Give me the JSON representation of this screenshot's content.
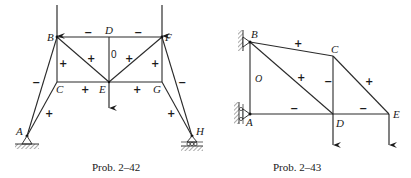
{
  "figures": [
    {
      "id": "prob-2-42",
      "caption": "Prob. 2–42",
      "nodes": {
        "A": {
          "label": "A"
        },
        "B": {
          "label": "B"
        },
        "C": {
          "label": "C"
        },
        "D": {
          "label": "D"
        },
        "E": {
          "label": "E"
        },
        "F": {
          "label": "F"
        },
        "G": {
          "label": "G"
        },
        "H": {
          "label": "H"
        }
      },
      "members": [
        {
          "from": "B",
          "to": "D",
          "sign": "−"
        },
        {
          "from": "D",
          "to": "F",
          "sign": "−"
        },
        {
          "from": "B",
          "to": "C",
          "sign": "+"
        },
        {
          "from": "B",
          "to": "E",
          "sign": "+"
        },
        {
          "from": "D",
          "to": "E",
          "sign": "0"
        },
        {
          "from": "F",
          "to": "E",
          "sign": "+"
        },
        {
          "from": "F",
          "to": "G",
          "sign": "+"
        },
        {
          "from": "C",
          "to": "E",
          "sign": "+"
        },
        {
          "from": "E",
          "to": "G",
          "sign": "+"
        },
        {
          "from": "A",
          "to": "B",
          "sign": "−"
        },
        {
          "from": "A",
          "to": "C",
          "sign": "+"
        },
        {
          "from": "H",
          "to": "F",
          "sign": "−"
        },
        {
          "from": "H",
          "to": "G",
          "sign": "+"
        }
      ],
      "loads": [
        "B",
        "F",
        "E"
      ],
      "supports": {
        "A": "pin",
        "H": "roller"
      }
    },
    {
      "id": "prob-2-43",
      "caption": "Prob. 2–43",
      "nodes": {
        "A": {
          "label": "A"
        },
        "B": {
          "label": "B"
        },
        "C": {
          "label": "C"
        },
        "D": {
          "label": "D"
        },
        "E": {
          "label": "E"
        }
      },
      "members": [
        {
          "from": "B",
          "to": "C",
          "sign": "+"
        },
        {
          "from": "B",
          "to": "A",
          "sign": "O"
        },
        {
          "from": "B",
          "to": "D",
          "sign": "+"
        },
        {
          "from": "C",
          "to": "D",
          "sign": "−"
        },
        {
          "from": "C",
          "to": "E",
          "sign": "+"
        },
        {
          "from": "A",
          "to": "D",
          "sign": "−"
        },
        {
          "from": "D",
          "to": "E",
          "sign": "−"
        }
      ],
      "loads": [
        "D",
        "E"
      ],
      "supports": {
        "B": "wall-pin",
        "A": "wall-roller"
      }
    }
  ]
}
